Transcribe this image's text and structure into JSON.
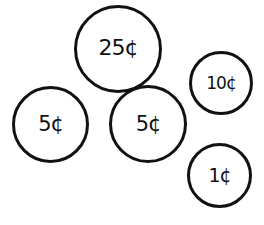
{
  "diagram": {
    "coins": [
      {
        "id": "quarter",
        "label": "25¢",
        "value_cents": 25
      },
      {
        "id": "nickel-left",
        "label": "5¢",
        "value_cents": 5
      },
      {
        "id": "nickel-middle",
        "label": "5¢",
        "value_cents": 5
      },
      {
        "id": "dime",
        "label": "10¢",
        "value_cents": 10
      },
      {
        "id": "penny",
        "label": "1¢",
        "value_cents": 1
      }
    ],
    "colors": {
      "stroke": "#111111",
      "background": "#ffffff"
    }
  }
}
